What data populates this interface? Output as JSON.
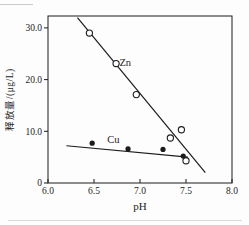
{
  "figure": {
    "background": "#fdfdfd",
    "ink_color": "#1c1c1c"
  },
  "chart_data": {
    "type": "scatter",
    "title": "",
    "xlabel": "pH",
    "ylabel": "释放量/(μg/L)",
    "xlim": [
      6.0,
      8.0
    ],
    "ylim": [
      0,
      32.3
    ],
    "grid": false,
    "legend": "inline-series-labels",
    "x_ticks": [
      {
        "value": 6.0,
        "label": "6.0"
      },
      {
        "value": 6.5,
        "label": "6.5"
      },
      {
        "value": 7.0,
        "label": "7.0"
      },
      {
        "value": 7.5,
        "label": "7.5"
      },
      {
        "value": 8.0,
        "label": "8.0"
      }
    ],
    "y_ticks": [
      {
        "value": 0,
        "label": "0"
      },
      {
        "value": 10,
        "label": "10.0"
      },
      {
        "value": 20,
        "label": "20.0"
      },
      {
        "value": 30,
        "label": "30.0"
      }
    ],
    "series": [
      {
        "name": "Zn",
        "marker": "open-circle",
        "label_pos": [
          6.84,
          23.2
        ],
        "points": [
          [
            6.45,
            29.0
          ],
          [
            6.74,
            23.1
          ],
          [
            6.96,
            17.1
          ],
          [
            7.33,
            8.7
          ],
          [
            7.45,
            10.3
          ],
          [
            7.5,
            4.3
          ]
        ],
        "trendline": [
          [
            6.32,
            32.0
          ],
          [
            7.71,
            2.0
          ]
        ]
      },
      {
        "name": "Cu",
        "marker": "filled-circle",
        "label_pos": [
          6.71,
          8.4
        ],
        "points": [
          [
            6.48,
            7.7
          ],
          [
            6.87,
            6.6
          ],
          [
            7.25,
            6.5
          ],
          [
            7.47,
            5.2
          ]
        ],
        "trendline": [
          [
            6.2,
            7.2
          ],
          [
            7.52,
            5.0
          ]
        ]
      }
    ]
  }
}
